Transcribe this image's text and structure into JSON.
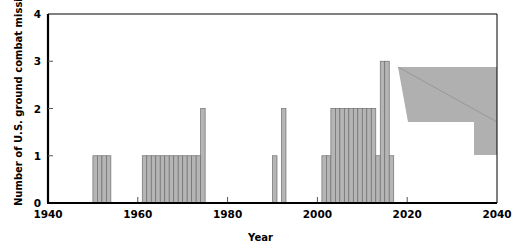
{
  "chart_data": {
    "type": "bar",
    "title": "",
    "subtitle": "",
    "xlabel": "Year",
    "ylabel": "Number of U.S. ground combat missions",
    "xlim": [
      1940,
      2040
    ],
    "ylim": [
      0,
      4
    ],
    "xticks": [
      1940,
      1960,
      1980,
      2000,
      2020,
      2040
    ],
    "xtick_labels": [
      "1940",
      "1960",
      "1980",
      "2000",
      "2020",
      "2040"
    ],
    "yticks": [
      0,
      1,
      2,
      3,
      4
    ],
    "ytick_labels": [
      "0",
      "1",
      "2",
      "3",
      "4"
    ],
    "grid": false,
    "legend": null,
    "bar_width_years": 1,
    "x": [
      1950,
      1951,
      1952,
      1953,
      1961,
      1962,
      1963,
      1964,
      1965,
      1966,
      1967,
      1968,
      1969,
      1970,
      1971,
      1972,
      1973,
      1974,
      1990,
      1992,
      2001,
      2002,
      2003,
      2004,
      2005,
      2006,
      2007,
      2008,
      2009,
      2010,
      2011,
      2012,
      2013,
      2014,
      2015,
      2016
    ],
    "values": [
      1,
      1,
      1,
      1,
      1,
      1,
      1,
      1,
      1,
      1,
      1,
      1,
      1,
      1,
      1,
      1,
      1,
      2,
      1,
      2,
      1,
      1,
      2,
      2,
      2,
      2,
      2,
      2,
      2,
      2,
      2,
      2,
      1,
      3,
      3,
      1
    ],
    "annotations": [
      {
        "name": "projection-region",
        "kind": "shaded-polygon",
        "label": "",
        "color": "#b0b0b0",
        "x_range": [
          2018,
          2040
        ],
        "y_range": [
          1,
          3
        ]
      }
    ]
  },
  "axes": {
    "y_label": "Number of U.S. ground combat missions",
    "x_label": "Year"
  }
}
